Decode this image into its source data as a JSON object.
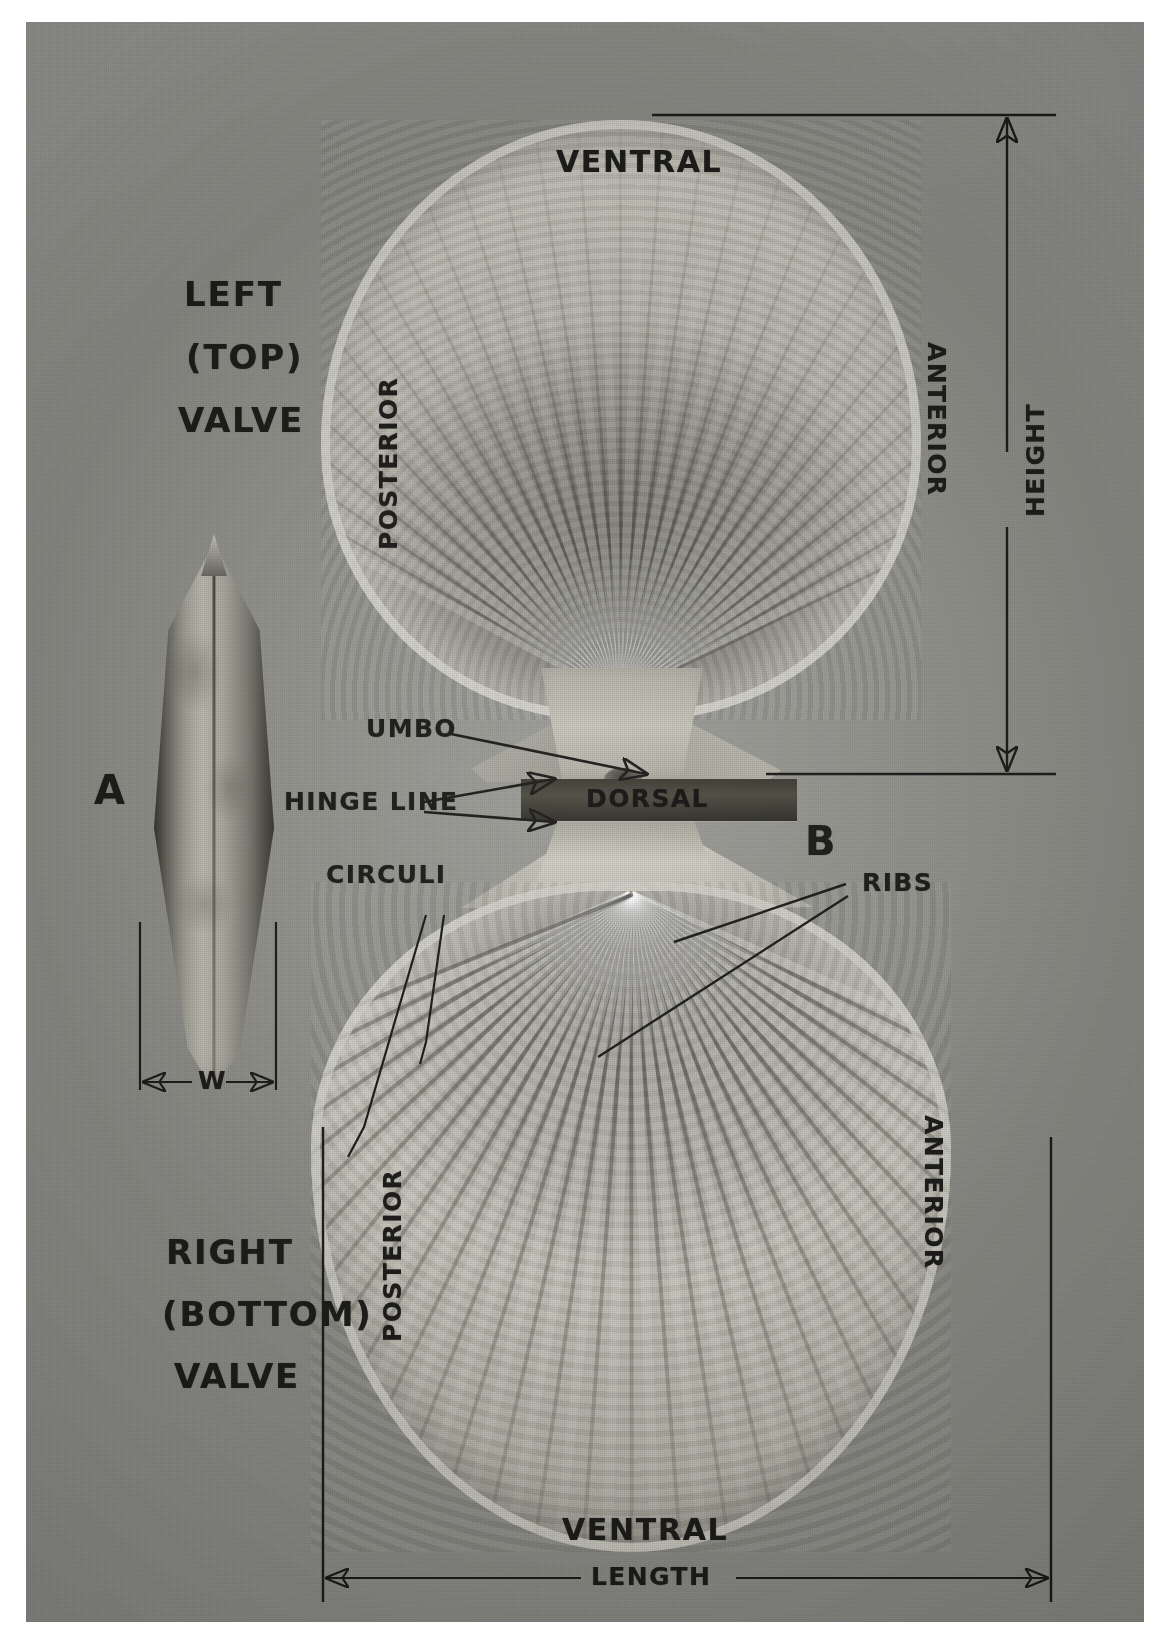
{
  "figure": {
    "type": "annotated-photograph",
    "background_color": "#93938e",
    "ink_color": "#181714",
    "border_color": "#ffffff"
  },
  "specimen_labels": {
    "a": "A",
    "b": "B"
  },
  "valve_captions": {
    "left_line1": "LEFT",
    "left_line2": "(TOP)",
    "left_line3": "VALVE",
    "right_line1": "RIGHT",
    "right_line2": "(BOTTOM)",
    "right_line3": "VALVE"
  },
  "orientation_labels": {
    "ventral_top": "VENTRAL",
    "ventral_bottom": "VENTRAL",
    "dorsal": "DORSAL",
    "posterior_top": "POSTERIOR",
    "posterior_bottom": "POSTERIOR",
    "anterior_top": "ANTERIOR",
    "anterior_bottom": "ANTERIOR"
  },
  "feature_callouts": [
    {
      "id": "umbo",
      "label": "UMBO",
      "arrows": 1
    },
    {
      "id": "hinge-line",
      "label": "HINGE LINE",
      "arrows": 2
    },
    {
      "id": "circuli",
      "label": "CIRCULI",
      "arrows": 2
    },
    {
      "id": "ribs",
      "label": "RIBS",
      "arrows": 2
    }
  ],
  "measurements": [
    {
      "id": "height",
      "label": "HEIGHT",
      "orientation": "vertical",
      "applies_to": "B"
    },
    {
      "id": "length",
      "label": "LENGTH",
      "orientation": "horizontal",
      "applies_to": "B"
    },
    {
      "id": "width",
      "label": "W",
      "orientation": "horizontal",
      "applies_to": "A"
    }
  ]
}
